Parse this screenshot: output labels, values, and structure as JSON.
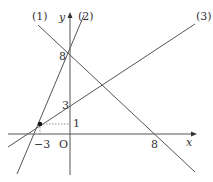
{
  "diagram": {
    "type": "coordinate-graph",
    "axes": {
      "x_label": "x",
      "y_label": "y",
      "origin_label": "O"
    },
    "lines": [
      {
        "id": "1",
        "label": "(1)",
        "desc": "line through (0,8) and (8,0)"
      },
      {
        "id": "2",
        "label": "(2)",
        "desc": "line through (-3,1) and (0,8)"
      },
      {
        "id": "3",
        "label": "(3)",
        "desc": "line through (-3,1) and (0,3)"
      }
    ],
    "ticks": {
      "y_8": "8",
      "y_3": "3",
      "y_1": "1",
      "x_neg3": "−3",
      "x_8": "8"
    },
    "points": [
      {
        "name": "intersection",
        "x": -3,
        "y": 1
      }
    ]
  }
}
